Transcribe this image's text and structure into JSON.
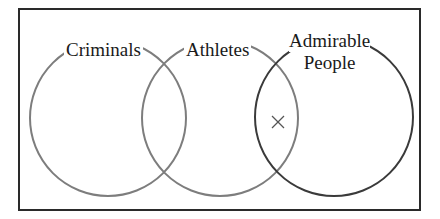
{
  "diagram": {
    "type": "venn",
    "sets": [
      {
        "name": "Criminals",
        "color": "#7a7a7a"
      },
      {
        "name": "Athletes",
        "color": "#7a7a7a"
      },
      {
        "name": "Admirable People",
        "color": "#3a3a3a"
      }
    ],
    "labels": {
      "criminals": "Criminals",
      "athletes": "Athletes",
      "admirable_line1": "Admirable",
      "admirable_line2": "People"
    },
    "marker": {
      "symbol": "×",
      "region": "Athletes ∩ Admirable People (not Criminals)"
    }
  }
}
